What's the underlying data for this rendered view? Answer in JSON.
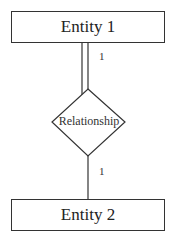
{
  "diagram": {
    "type": "er-diagram",
    "entities": [
      {
        "id": "e1",
        "label": "Entity 1"
      },
      {
        "id": "e2",
        "label": "Entity 2"
      }
    ],
    "relationships": [
      {
        "id": "r1",
        "label": "Relationship"
      }
    ],
    "connections": [
      {
        "from": "e1",
        "to": "r1",
        "cardinality": "1",
        "participation": "total (double line)"
      },
      {
        "from": "r1",
        "to": "e2",
        "cardinality": "1",
        "participation": "partial (single line)"
      }
    ]
  },
  "labels": {
    "entity1": "Entity 1",
    "entity2": "Entity 2",
    "relationship": "Relationship",
    "card_top": "1",
    "card_bottom": "1"
  },
  "colors": {
    "stroke": "#333333",
    "background": "#ffffff"
  }
}
